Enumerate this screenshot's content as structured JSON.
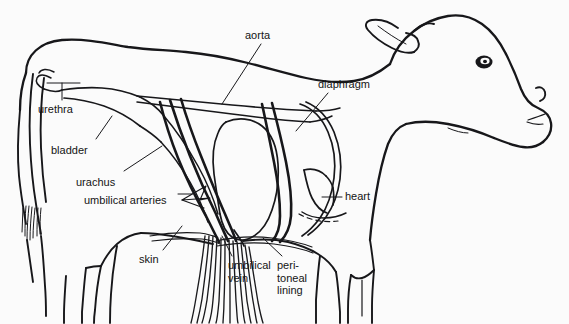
{
  "figure": {
    "background_color": "#fbfbfb",
    "line_color": "#17171a",
    "style": "black and white line drawing"
  },
  "labels": [
    {
      "id": "urethra",
      "text": "urethra",
      "x": 38,
      "y": 105,
      "structure": "urethra",
      "leader": "short vertical line up to urethral tube at pelvic outlet"
    },
    {
      "id": "bladder",
      "text": "bladder",
      "x": 51,
      "y": 146,
      "structure": "urinary bladder",
      "leader": "diagonal line up-right to elongated bladder outline"
    },
    {
      "id": "urachus",
      "text": "urachus",
      "x": 76,
      "y": 178,
      "structure": "urachus",
      "leader": "diagonal line up-right to urachus duct"
    },
    {
      "id": "umbilical-arteries",
      "text": "umbilical arteries",
      "x": 84,
      "y": 196,
      "structure": "umbilical arteries",
      "leader": "horizontal line right with arrow fork to paired arteries"
    },
    {
      "id": "skin",
      "text": "skin",
      "x": 139,
      "y": 256,
      "structure": "skin / body wall",
      "leader": "diagonal line up-right to ventral body wall"
    },
    {
      "id": "umbilical-vein",
      "text": "umbilical\nvein",
      "x": 228,
      "y": 262,
      "structure": "umbilical vein",
      "leader": "diagonal line up-left into umbilical cord"
    },
    {
      "id": "peritoneal-lining",
      "text": "peri-\ntoneal\nlining",
      "x": 277,
      "y": 262,
      "structure": "peritoneal lining",
      "leader": "diagonal line up-left to peritoneum at the navel"
    },
    {
      "id": "aorta",
      "text": "aorta",
      "x": 245,
      "y": 30,
      "structure": "aorta",
      "leader": "long diagonal line down-right to aorta"
    },
    {
      "id": "diaphragm",
      "text": "diaphragm",
      "x": 318,
      "y": 79,
      "structure": "diaphragm",
      "leader": "diagonal line down-left to diaphragm dome"
    },
    {
      "id": "heart",
      "text": "heart",
      "x": 345,
      "y": 192,
      "structure": "heart",
      "leader": "short horizontal line left to heart outline"
    }
  ]
}
